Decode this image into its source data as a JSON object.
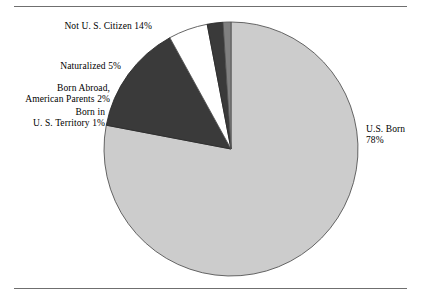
{
  "chart_data": {
    "type": "pie",
    "title": "",
    "subtitle": "",
    "xlabel": "",
    "ylabel": "",
    "legend_position": "none",
    "grid": false,
    "units": "percent",
    "start_angle_deg": 0,
    "direction": "clockwise",
    "categories": [
      "U.S. Born",
      "Not U. S. Citizen",
      "Naturalized",
      "Born Abroad, American Parents",
      "Born in U. S. Territory"
    ],
    "values": [
      78,
      14,
      5,
      2,
      1
    ],
    "slices": [
      {
        "name": "us-born",
        "label_lines": [
          "U.S. Born",
          "78%"
        ],
        "value": 78,
        "color": "#cccccc",
        "stroke": "#555555"
      },
      {
        "name": "not-us-citizen",
        "label_lines": [
          "Not U. S. Citizen 14%"
        ],
        "value": 14,
        "color": "#3a3a3a",
        "stroke": "#2a2a2a"
      },
      {
        "name": "naturalized",
        "label_lines": [
          "Naturalized 5%"
        ],
        "value": 5,
        "color": "#ffffff",
        "stroke": "#555555"
      },
      {
        "name": "born-abroad-american-parents",
        "label_lines": [
          "Born Abroad,",
          "American Parents 2%"
        ],
        "value": 2,
        "color": "#3a3a3a",
        "stroke": "#2a2a2a"
      },
      {
        "name": "born-in-us-territory",
        "label_lines": [
          "Born in",
          "U. S. Territory 1%"
        ],
        "value": 1,
        "color": "#808080",
        "stroke": "#555555"
      }
    ]
  },
  "labels": {
    "not_us_citizen": "Not U. S. Citizen 14%",
    "naturalized": "Naturalized 5%",
    "born_abroad_line1": "Born Abroad,",
    "born_abroad_line2": "American Parents 2%",
    "territory_line1": "Born in",
    "territory_line2": "U. S. Territory 1%",
    "us_born_line1": "U.S. Born",
    "us_born_line2": "78%"
  },
  "colors": {
    "us_born": "#cccccc",
    "dark_slice": "#3a3a3a",
    "naturalized": "#ffffff",
    "territory": "#808080",
    "rule": "#6f6f6f",
    "background": "#ffffff",
    "text": "#000000"
  }
}
